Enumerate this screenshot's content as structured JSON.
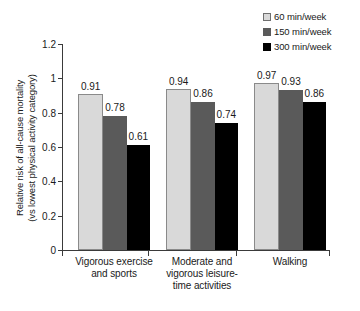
{
  "chart_data": {
    "type": "bar",
    "title": "",
    "subtitle": "",
    "xlabel": "",
    "ylabel": "Relative risk of all-cause mortality (vs lowest physical activity category)",
    "ylabel_lines": [
      "Relative risk of all-cause mortality",
      "(vs lowest physical activity category)"
    ],
    "ylim": [
      0,
      1.2
    ],
    "yticks": [
      "0",
      "0.2",
      "0.4",
      "0.6",
      "0.8",
      "1",
      "1.2"
    ],
    "ytick_values": [
      0,
      0.2,
      0.4,
      0.6,
      0.8,
      1,
      1.2
    ],
    "grid": false,
    "legend_position": "top-right",
    "categories": [
      "Vigorous exercise and sports",
      "Moderate and vigorous leisure-time activities",
      "Walking"
    ],
    "category_label_lines": [
      [
        "Vigorous exercise",
        "and sports"
      ],
      [
        "Moderate and",
        "vigorous leisure-",
        "time activities"
      ],
      [
        "Walking"
      ]
    ],
    "series": [
      {
        "name": "60 min/week",
        "color": "#d9d9d9",
        "values": [
          0.91,
          0.94,
          0.97
        ],
        "labels": [
          "0.91",
          "0.94",
          "0.97"
        ]
      },
      {
        "name": "150 min/week",
        "color": "#5a5a5a",
        "values": [
          0.78,
          0.86,
          0.93
        ],
        "labels": [
          "0.78",
          "0.86",
          "0.93"
        ]
      },
      {
        "name": "300 min/week",
        "color": "#000000",
        "values": [
          0.61,
          0.74,
          0.86
        ],
        "labels": [
          "0.61",
          "0.74",
          "0.86"
        ]
      }
    ]
  },
  "legend": {
    "items": [
      {
        "label": "60 min/week",
        "color": "#d9d9d9"
      },
      {
        "label": "150 min/week",
        "color": "#5a5a5a"
      },
      {
        "label": "300 min/week",
        "color": "#000000"
      }
    ]
  },
  "colors": {
    "axis": "#3a3a3a",
    "text": "#1a1a1a",
    "background": "#ffffff",
    "series_light": "#d9d9d9",
    "series_mid": "#5a5a5a",
    "series_dark": "#000000"
  }
}
